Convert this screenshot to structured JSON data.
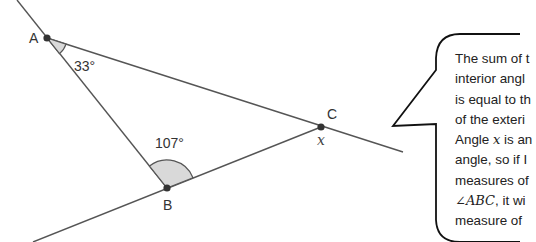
{
  "diagram": {
    "points": {
      "A": {
        "label": "A",
        "x": 47,
        "y": 38
      },
      "B": {
        "label": "B",
        "x": 167,
        "y": 188
      },
      "C": {
        "label": "C",
        "x": 321,
        "y": 127
      }
    },
    "angles": {
      "at_A": {
        "label": "33°",
        "value": 33
      },
      "at_B": {
        "label": "107°",
        "value": 107
      },
      "at_C": {
        "label": "x"
      }
    },
    "colors": {
      "line": "#555555",
      "point": "#333333",
      "angle_fill": "#d9d9d9",
      "bubble_stroke": "#111111"
    }
  },
  "speech_bubble": {
    "lines": [
      "The sum of t",
      "interior angl",
      "is equal to th",
      "of the exteri",
      "Angle ",
      "angle, so if I",
      "measures of",
      ", it wi",
      "measure of"
    ],
    "line5_var": "x",
    "line5_rest": " is an",
    "line8_math": "∠ABC"
  }
}
